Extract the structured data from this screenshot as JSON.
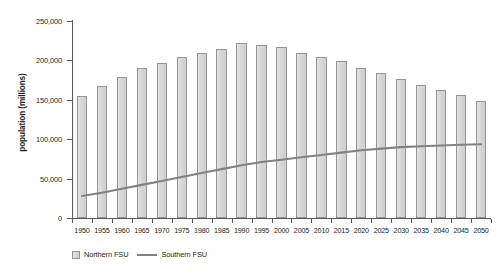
{
  "chart_data": {
    "type": "bar",
    "title": "",
    "xlabel": "",
    "ylabel": "population (millions)",
    "ylim": [
      0,
      250000
    ],
    "yticks": [
      0,
      50000,
      100000,
      150000,
      200000,
      250000
    ],
    "ytick_labels": [
      "0",
      "50,000",
      "100,000",
      "150,000",
      "200,000",
      "250,000"
    ],
    "grid": false,
    "legend_position": "bottom-left",
    "categories": [
      "1950",
      "1955",
      "1960",
      "1965",
      "1970",
      "1975",
      "1980",
      "1985",
      "1990",
      "1995",
      "2000",
      "2005",
      "2010",
      "2015",
      "2020",
      "2025",
      "2030",
      "2035",
      "2040",
      "2045",
      "2050"
    ],
    "series": [
      {
        "name": "Northern FSU",
        "type": "bar",
        "color": "#d6d6d4",
        "edge_color": "#939598",
        "values": [
          155000,
          167000,
          179000,
          190000,
          197000,
          204000,
          209000,
          215000,
          222000,
          219000,
          217000,
          210000,
          204000,
          199000,
          191000,
          184000,
          176000,
          169000,
          163000,
          156000,
          149000
        ]
      },
      {
        "name": "Southern FSU",
        "type": "line",
        "color": "#808285",
        "values": [
          28000,
          32000,
          37000,
          42000,
          47000,
          52000,
          57000,
          62000,
          67000,
          71000,
          74000,
          77000,
          80000,
          83000,
          86000,
          88000,
          90000,
          91000,
          92000,
          93000,
          93500
        ]
      }
    ]
  },
  "legend": {
    "items": [
      {
        "label": "Northern FSU",
        "marker": "bar-swatch"
      },
      {
        "label": "Southern FSU",
        "marker": "line-swatch"
      }
    ]
  }
}
